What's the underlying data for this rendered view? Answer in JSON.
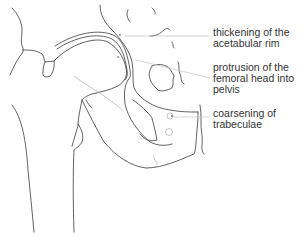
{
  "diagram": {
    "colors": {
      "line": "#3a3a3a",
      "leader": "#c4c4c4",
      "text": "#333333",
      "background": "#ffffff"
    },
    "labels": [
      {
        "id": "acetabular-rim",
        "lines": [
          "thickening of the",
          "acetabular rim"
        ]
      },
      {
        "id": "femoral-head-protrusion",
        "lines": [
          "protrusion of the",
          "femoral head into",
          "pelvis"
        ]
      },
      {
        "id": "trabeculae",
        "lines": [
          "coarsening of",
          "trabeculae"
        ]
      }
    ]
  }
}
